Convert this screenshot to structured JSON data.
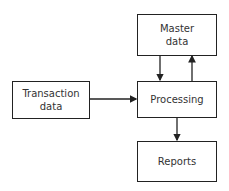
{
  "diagram": {
    "nodes": [
      {
        "id": "master",
        "label_line1": "Master",
        "label_line2": "data"
      },
      {
        "id": "transaction",
        "label_line1": "Transaction",
        "label_line2": "data"
      },
      {
        "id": "processing",
        "label": "Processing"
      },
      {
        "id": "reports",
        "label": "Reports"
      }
    ],
    "edges": [
      {
        "from": "transaction",
        "to": "processing"
      },
      {
        "from": "master",
        "to": "processing"
      },
      {
        "from": "processing",
        "to": "master"
      },
      {
        "from": "processing",
        "to": "reports"
      }
    ]
  }
}
